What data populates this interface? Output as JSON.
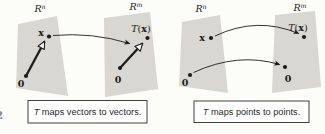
{
  "colors": {
    "ink": "#1c1c1c",
    "plane_fill": "#d8d7d2",
    "background": "#fcfcf9",
    "caption_border": "#3f3f3f"
  },
  "margin_fragment": "2",
  "figure1": {
    "domain_space": {
      "base": "R",
      "sup": "n"
    },
    "codomain_space": {
      "base": "R",
      "sup": "m"
    },
    "vector_label": "x",
    "origin_label": "0",
    "image_origin_label": "0",
    "image_label": {
      "T": "T",
      "open": "(",
      "arg": "x",
      "close": ")"
    },
    "caption": {
      "T": "T",
      "rest": "maps vectors to vectors."
    }
  },
  "figure2": {
    "domain_space": {
      "base": "R",
      "sup": "n"
    },
    "codomain_space": {
      "base": "R",
      "sup": "m"
    },
    "point_label": "x",
    "origin_label": "0",
    "image_origin_label": "0",
    "image_label": {
      "T": "T",
      "open": "(",
      "arg": "x",
      "close": ")"
    },
    "caption": {
      "T": "T",
      "rest": "maps points to points."
    }
  }
}
